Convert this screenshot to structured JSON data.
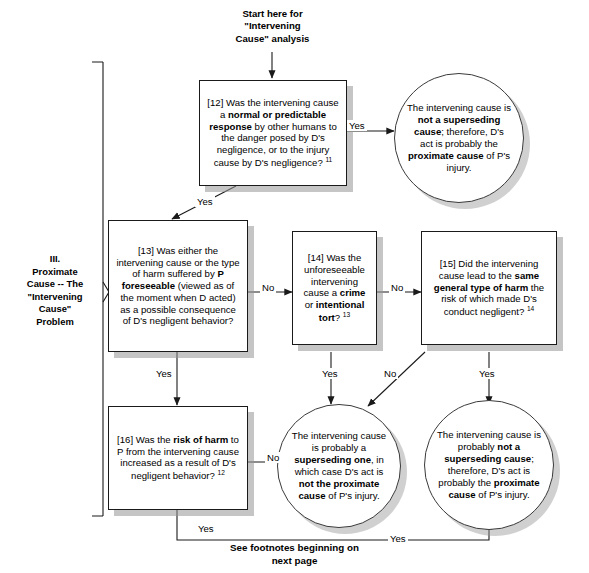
{
  "title_block": {
    "text": "Start here for\n\"Intervening\nCause\" analysis"
  },
  "section": {
    "label": "III.\nProximate\nCause -- The\n\"Intervening\nCause\"\nProblem"
  },
  "footer": {
    "text": "See footnotes beginning on\nnext page"
  },
  "nodes": {
    "q12": {
      "id": "[12]",
      "parts": [
        {
          "t": "[12] Was the intervening cause a ",
          "b": false
        },
        {
          "t": "normal or predictable response",
          "b": true
        },
        {
          "t": " by other humans to the danger posed by D's negligence, or to the injury cause by D's negligence? ",
          "b": false
        },
        {
          "t": "11",
          "b": false,
          "sup": true
        }
      ]
    },
    "q13": {
      "id": "[13]",
      "parts": [
        {
          "t": "[13] Was either the intervening cause or the type of harm suffered by ",
          "b": false
        },
        {
          "t": "P foreseeable",
          "b": true
        },
        {
          "t": " (viewed as of the moment when D acted) as a possible consequence of D's negligent behavior?",
          "b": false
        }
      ]
    },
    "q14": {
      "id": "[14]",
      "parts": [
        {
          "t": "[14] Was the unforeseeable intervening cause a ",
          "b": false
        },
        {
          "t": "crime",
          "b": true
        },
        {
          "t": " or ",
          "b": false
        },
        {
          "t": "intentional tort",
          "b": true
        },
        {
          "t": "? ",
          "b": false
        },
        {
          "t": "13",
          "b": false,
          "sup": true
        }
      ]
    },
    "q15": {
      "id": "[15]",
      "parts": [
        {
          "t": "[15] Did the intervening cause lead to the ",
          "b": false
        },
        {
          "t": "same general type of harm",
          "b": true
        },
        {
          "t": " the risk of which made D's conduct negligent? ",
          "b": false
        },
        {
          "t": "14",
          "b": false,
          "sup": true
        }
      ]
    },
    "q16": {
      "id": "[16]",
      "parts": [
        {
          "t": "[16] Was the ",
          "b": false
        },
        {
          "t": "risk of harm",
          "b": true
        },
        {
          "t": " to P from the intervening cause increased as a result of D's negligent behavior? ",
          "b": false
        },
        {
          "t": "12",
          "b": false,
          "sup": true
        }
      ]
    },
    "outcome_top_right": {
      "parts": [
        {
          "t": "The intervening cause is ",
          "b": false
        },
        {
          "t": "not a superseding cause",
          "b": true
        },
        {
          "t": "; therefore, D's act is probably the ",
          "b": false
        },
        {
          "t": "proximate cause",
          "b": true
        },
        {
          "t": " of P's injury.",
          "b": false
        }
      ]
    },
    "outcome_bottom_mid": {
      "parts": [
        {
          "t": "The intervening cause is probably a ",
          "b": false
        },
        {
          "t": "superseding one",
          "b": true
        },
        {
          "t": ", in which case D's act is ",
          "b": false
        },
        {
          "t": "not the proximate cause",
          "b": true
        },
        {
          "t": " of P's injury.",
          "b": false
        }
      ]
    },
    "outcome_bottom_right": {
      "parts": [
        {
          "t": "The intervening cause is probably ",
          "b": false
        },
        {
          "t": "not a superseding cause",
          "b": true
        },
        {
          "t": "; therefore, D's act is probably the ",
          "b": false
        },
        {
          "t": "proximate cause",
          "b": true
        },
        {
          "t": " of P's injury.",
          "b": false
        }
      ]
    }
  },
  "edges": [
    {
      "name": "q12-yes-to-outcome-top-right",
      "label": "Yes",
      "x": 347,
      "y": 120
    },
    {
      "name": "q12-yes-to-q13",
      "label": "Yes",
      "x": 195,
      "y": 196
    },
    {
      "name": "q13-no-to-q14",
      "label": "No",
      "x": 260,
      "y": 282
    },
    {
      "name": "q14-no-to-q15",
      "label": "No",
      "x": 389,
      "y": 282
    },
    {
      "name": "q13-yes-to-q16",
      "label": "Yes",
      "x": 154,
      "y": 368
    },
    {
      "name": "q14-yes-to-outcome-bottom-mid",
      "label": "Yes",
      "x": 320,
      "y": 368
    },
    {
      "name": "q15-no-to-outcome-bottom-mid",
      "label": "No",
      "x": 382,
      "y": 368
    },
    {
      "name": "q15-yes-to-outcome-bottom-right",
      "label": "Yes",
      "x": 477,
      "y": 368
    },
    {
      "name": "q16-no-to-outcome-bottom-mid",
      "label": "No",
      "x": 265,
      "y": 452
    },
    {
      "name": "q16-yes-down",
      "label": "Yes",
      "x": 196,
      "y": 523
    },
    {
      "name": "q16-yes-to-outcome-bottom-right",
      "label": "Yes",
      "x": 388,
      "y": 533
    }
  ],
  "colors": {
    "line": "#1a1a1a",
    "shadow": "#969696",
    "background": "#ffffff",
    "text": "#000000"
  }
}
